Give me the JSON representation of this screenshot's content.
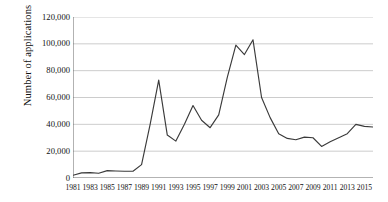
{
  "chart_data": {
    "type": "line",
    "title": "",
    "xlabel": "",
    "ylabel": "Number of applications",
    "ylim": [
      0,
      120000
    ],
    "xlim": [
      1981,
      2016
    ],
    "grid": true,
    "legend": "none",
    "y_ticks": [
      0,
      20000,
      40000,
      60000,
      80000,
      100000,
      120000
    ],
    "y_tick_labels": [
      "0",
      "20,000",
      "40,000",
      "60,000",
      "80,000",
      "100,000",
      "120,000"
    ],
    "x_ticks": [
      1981,
      1983,
      1985,
      1987,
      1989,
      1991,
      1993,
      1995,
      1997,
      1999,
      2001,
      2003,
      2005,
      2007,
      2009,
      2011,
      2013,
      2015
    ],
    "x_tick_labels": [
      "1981",
      "1983",
      "1985",
      "1987",
      "1989",
      "1991",
      "1993",
      "1995",
      "1997",
      "1999",
      "2001",
      "2003",
      "2005",
      "2007",
      "2009",
      "2011",
      "2013",
      "2015"
    ],
    "series": [
      {
        "name": "Number of applications",
        "color": "#3a3a3a",
        "x": [
          1981,
          1982,
          1983,
          1984,
          1985,
          1986,
          1987,
          1988,
          1989,
          1990,
          1991,
          1992,
          1993,
          1994,
          1995,
          1996,
          1997,
          1998,
          1999,
          2000,
          2001,
          2002,
          2003,
          2004,
          2005,
          2006,
          2007,
          2008,
          2009,
          2010,
          2011,
          2012,
          2013,
          2014,
          2015,
          2016
        ],
        "values": [
          2000,
          3800,
          4000,
          3500,
          5500,
          5200,
          5000,
          5000,
          10000,
          40000,
          73000,
          32000,
          27500,
          40000,
          54000,
          43000,
          37500,
          47000,
          75000,
          99000,
          92000,
          103000,
          60000,
          45000,
          33000,
          29500,
          28500,
          30500,
          30000,
          23500,
          27000,
          30000,
          33000,
          40000,
          38500,
          38000
        ]
      }
    ]
  }
}
